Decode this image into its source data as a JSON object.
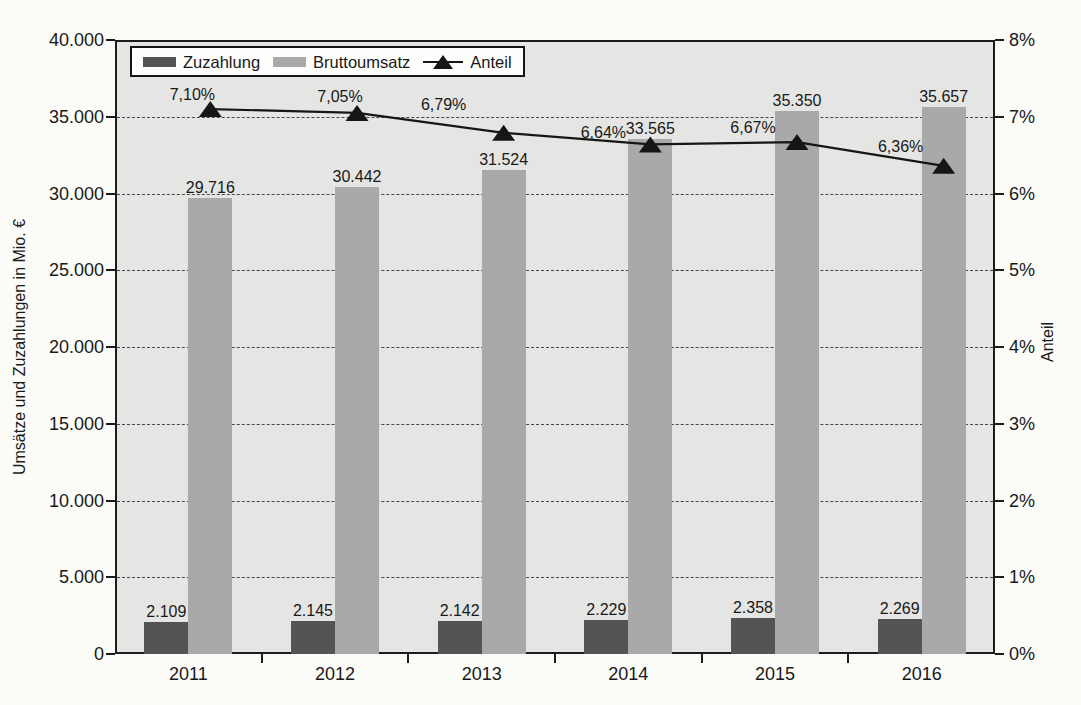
{
  "chart_data": {
    "type": "bar+line combo",
    "categories": [
      "2011",
      "2012",
      "2013",
      "2014",
      "2015",
      "2016"
    ],
    "series": [
      {
        "name": "Zuzahlung",
        "type": "bar",
        "axis": "left",
        "color": "#545454",
        "values": [
          2109,
          2145,
          2142,
          2229,
          2358,
          2269
        ],
        "labels": [
          "2.109",
          "2.145",
          "2.142",
          "2.229",
          "2.358",
          "2.269"
        ]
      },
      {
        "name": "Bruttoumsatz",
        "type": "bar",
        "axis": "left",
        "color": "#a9a9a9",
        "values": [
          29716,
          30442,
          31524,
          33565,
          35350,
          35657
        ],
        "labels": [
          "29.716",
          "30.442",
          "31.524",
          "33.565",
          "35.350",
          "35.657"
        ]
      },
      {
        "name": "Anteil",
        "type": "line",
        "axis": "right",
        "marker": "filled-triangle-up",
        "color": "#161616",
        "values": [
          7.1,
          7.05,
          6.79,
          6.64,
          6.67,
          6.36
        ],
        "labels": [
          "7,10%",
          "7,05%",
          "6,79%",
          "6,64%",
          "6,67%",
          "6,36%"
        ],
        "label_offsets": [
          [
            -18,
            -14
          ],
          [
            -17,
            -16
          ],
          [
            -60,
            -28
          ],
          [
            -47,
            -11
          ],
          [
            -44,
            -14
          ],
          [
            -43,
            -19
          ]
        ]
      }
    ],
    "left_axis": {
      "title": "Umsätze und Zuzahlungen in Mio. €",
      "min": 0,
      "max": 40000,
      "step": 5000,
      "tick_labels": [
        "0",
        "5.000",
        "10.000",
        "15.000",
        "20.000",
        "25.000",
        "30.000",
        "35.000",
        "40.000"
      ]
    },
    "right_axis": {
      "title": "Anteil",
      "min": 0,
      "max": 8,
      "step": 1,
      "tick_labels": [
        "0%",
        "1%",
        "2%",
        "3%",
        "4%",
        "5%",
        "6%",
        "7%",
        "8%"
      ]
    },
    "legend": {
      "position": "top-left-inside",
      "bordered": true
    },
    "grid": {
      "horizontal": true,
      "style": "dashed",
      "color": "#474747"
    },
    "plot_background": "#e5e5e3",
    "page_background": "#fbfbf8"
  }
}
